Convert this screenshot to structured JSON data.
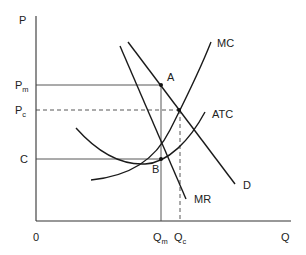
{
  "diagram": {
    "axes": {
      "y_label": "P",
      "x_label": "Q",
      "origin_label": "0"
    },
    "price_levels": {
      "pm": {
        "main": "P",
        "sub": "m"
      },
      "pc": {
        "main": "P",
        "sub": "c"
      },
      "c": {
        "main": "C"
      }
    },
    "quantity_levels": {
      "qm": {
        "main": "Q",
        "sub": "m"
      },
      "qc": {
        "main": "Q",
        "sub": "c"
      }
    },
    "curves": {
      "mc": "MC",
      "atc": "ATC",
      "d": "D",
      "mr": "MR"
    },
    "points": {
      "a": "A",
      "b": "B"
    },
    "colors": {
      "line": "#1a1a1a",
      "text": "#222222",
      "background": "#ffffff"
    }
  }
}
